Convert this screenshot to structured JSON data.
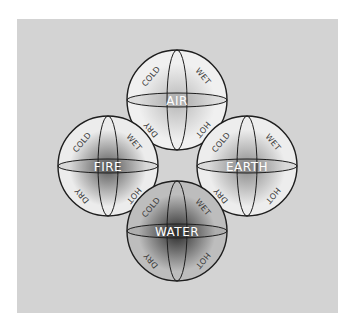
{
  "diagram": {
    "background_color": "#d3d3d3",
    "stroke_color": "#1e1e1e",
    "elements": [
      {
        "id": "air",
        "name": "AIR",
        "cx": 177,
        "cy": 100,
        "r": 50,
        "shade": "#f0f0f0",
        "core": "#b8b8b8",
        "qualities": {
          "top_left": "COLD",
          "top_right": "WET",
          "bottom_left": "DRY",
          "bottom_right": "HOT"
        }
      },
      {
        "id": "fire",
        "name": "FIRE",
        "cx": 108,
        "cy": 166,
        "r": 50,
        "shade": "#ececec",
        "core": "#5a5a5a",
        "qualities": {
          "top_left": "COLD",
          "top_right": "WET",
          "bottom_left": "DRY",
          "bottom_right": "HOT"
        }
      },
      {
        "id": "earth",
        "name": "EARTH",
        "cx": 247,
        "cy": 166,
        "r": 50,
        "shade": "#ededed",
        "core": "#8a8a8a",
        "qualities": {
          "top_left": "COLD",
          "top_right": "WET",
          "bottom_left": "DRY",
          "bottom_right": "HOT"
        }
      },
      {
        "id": "water",
        "name": "WATER",
        "cx": 177,
        "cy": 231,
        "r": 50,
        "shade": "#bdbdbd",
        "core": "#2a2a2a",
        "qualities": {
          "top_left": "COLD",
          "top_right": "WET",
          "bottom_left": "DRY",
          "bottom_right": "HOT"
        }
      }
    ]
  }
}
